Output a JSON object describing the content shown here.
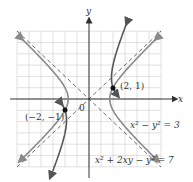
{
  "diagram": {
    "type": "coordinate-plane",
    "axes": {
      "x_label": "x",
      "y_label": "y",
      "origin_label": "0"
    },
    "grid": {
      "range": [
        -6,
        6
      ],
      "step": 1,
      "color": "#c8c8c8"
    },
    "asymptotes": [
      {
        "equation": "y = x",
        "style": "dashed"
      },
      {
        "equation": "y = -x",
        "style": "dashed"
      }
    ],
    "curves": [
      {
        "name": "hyperbola-1",
        "equation_label": "x² − y² = 3",
        "color": "#8a8a8a"
      },
      {
        "name": "hyperbola-2",
        "equation_label": "x² + 2xy − y² = 7",
        "color": "#555555"
      }
    ],
    "points": [
      {
        "label": "(2, 1)",
        "x": 2,
        "y": 1
      },
      {
        "label": "(−2, −1)",
        "x": -2,
        "y": -1
      }
    ],
    "colors": {
      "axis": "#333333",
      "point": "#111111",
      "grid": "#cccccc"
    }
  }
}
